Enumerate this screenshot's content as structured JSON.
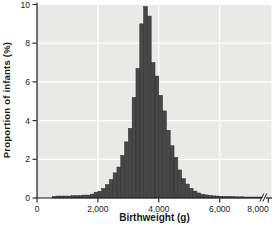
{
  "chart_data": {
    "type": "bar",
    "subtype": "histogram",
    "title": "",
    "xlabel": "Birthweight (g)",
    "ylabel": "Proportion of infants (%)",
    "xlim": [
      0,
      8000
    ],
    "ylim": [
      0,
      10
    ],
    "grid": "on",
    "legend": "none",
    "axis_break": {
      "axis": "x",
      "between": [
        6000,
        8000
      ]
    },
    "y_ticks": [
      {
        "value": 0,
        "label": "0"
      },
      {
        "value": 2,
        "label": "2"
      },
      {
        "value": 4,
        "label": "4"
      },
      {
        "value": 6,
        "label": "6"
      },
      {
        "value": 8,
        "label": "8"
      },
      {
        "value": 10,
        "label": "10"
      }
    ],
    "x_ticks": [
      {
        "value": 0,
        "label": "0"
      },
      {
        "value": 2000,
        "label": "2,000"
      },
      {
        "value": 4000,
        "label": "4,000"
      },
      {
        "value": 6000,
        "label": "6,000"
      },
      {
        "value": 8000,
        "label": "8,000"
      }
    ],
    "bin_width_g": 125,
    "bin_starts": [
      500,
      625,
      750,
      875,
      1000,
      1125,
      1250,
      1375,
      1500,
      1625,
      1750,
      1875,
      2000,
      2125,
      2250,
      2375,
      2500,
      2625,
      2750,
      2875,
      3000,
      3125,
      3250,
      3375,
      3500,
      3625,
      3750,
      3875,
      4000,
      4125,
      4250,
      4375,
      4500,
      4625,
      4750,
      4875,
      5000,
      5125,
      5250,
      5375,
      5500,
      5625,
      5750,
      5875,
      6000,
      6125,
      6250,
      6375,
      6500,
      6625,
      6750,
      6875,
      7000,
      7125,
      7250,
      7375,
      7500,
      7625
    ],
    "values": [
      0.08,
      0.1,
      0.1,
      0.1,
      0.1,
      0.12,
      0.12,
      0.13,
      0.15,
      0.15,
      0.2,
      0.3,
      0.35,
      0.5,
      0.7,
      0.95,
      1.3,
      1.6,
      2.2,
      2.9,
      3.6,
      5.2,
      6.7,
      9.0,
      9.9,
      9.4,
      7.0,
      6.3,
      5.3,
      4.5,
      3.5,
      2.7,
      2.1,
      1.45,
      1.0,
      0.72,
      0.5,
      0.36,
      0.26,
      0.2,
      0.16,
      0.13,
      0.11,
      0.1,
      0.09,
      0.08,
      0.08,
      0.07,
      0.07,
      0.06,
      0.06,
      0.06,
      0.05,
      0.05,
      0.05,
      0.05,
      0.05,
      0.05
    ]
  },
  "colors": {
    "page_bg": "#ffffff",
    "plot_bg": "#e9e9e7",
    "grid": "#ffffff",
    "bar_fill": "#474747",
    "bar_stroke": "#2e2e2e",
    "axis": "#1a1a1a",
    "text": "#1a1a1a"
  }
}
